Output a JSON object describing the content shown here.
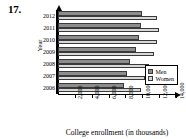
{
  "problem_number": "17.",
  "chart_data": {
    "type": "bar",
    "orientation": "horizontal",
    "title": "",
    "xlabel": "College enrollment (in thousands)",
    "ylabel": "Year",
    "categories": [
      "2012",
      "2011",
      "2010",
      "2009",
      "2008",
      "2007",
      "2006"
    ],
    "series": [
      {
        "name": "Men",
        "color": "#8d8d8d",
        "values": [
          10000,
          9800,
          9600,
          9300,
          8600,
          8200,
          7800
        ]
      },
      {
        "name": "Women",
        "color": "#d9d9d9",
        "values": [
          11800,
          12000,
          11800,
          11400,
          10800,
          10300,
          9900
        ]
      }
    ],
    "xticks": [
      "2,000",
      "4,000",
      "6,000",
      "8,000",
      "10,000",
      "12,000",
      "14,000"
    ],
    "xtick_values": [
      2000,
      4000,
      6000,
      8000,
      10000,
      12000,
      14000
    ],
    "xlim": [
      0,
      14000
    ],
    "grid": false,
    "legend_position": "bottom-right",
    "legend": [
      "Men",
      "Women"
    ]
  }
}
